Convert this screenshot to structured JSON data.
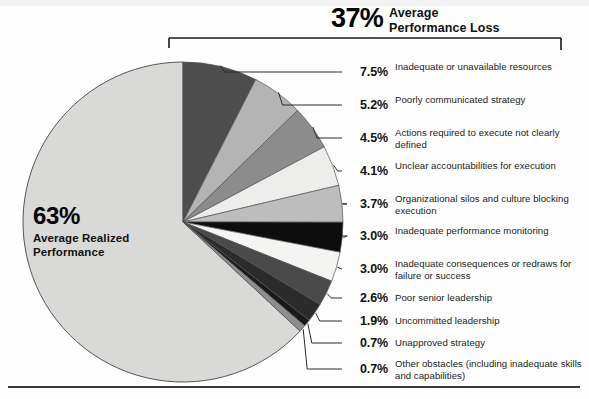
{
  "header": {
    "percent": "37%",
    "line1": "Average",
    "line2": "Performance Loss"
  },
  "center": {
    "percent": "63%",
    "line1": "Average Realized",
    "line2": "Performance"
  },
  "chart_data": {
    "type": "pie",
    "title": "37% Average Performance Loss",
    "center_label": "63% Average Realized Performance",
    "units": "percent",
    "legend_position": "right",
    "grid": false,
    "categories": [
      "Average Realized Performance",
      "Inadequate or unavailable resources",
      "Poorly communicated strategy",
      "Actions required to execute not clearly defined",
      "Unclear accountabilities for execution",
      "Organizational silos and culture blocking execution",
      "Inadequate performance monitoring",
      "Inadequate consequences or redraws for failure or success",
      "Poor senior leadership",
      "Uncommitted leadership",
      "Unapproved strategy",
      "Other obstacles (including inadequate skills and capabilities)"
    ],
    "values": [
      63.0,
      7.5,
      5.2,
      4.5,
      4.1,
      3.7,
      3.0,
      3.0,
      2.6,
      1.9,
      0.7,
      0.7
    ],
    "colors": [
      "#d9d9d7",
      "#4d4d4d",
      "#b4b4b4",
      "#8c8c8c",
      "#ededeb",
      "#bdbdbd",
      "#0d0d0d",
      "#f4f4f2",
      "#4a4a4a",
      "#2b2b2b",
      "#1a1a1a",
      "#8e8e8e"
    ],
    "loss_total": 37.0,
    "realized_total": 63.0
  },
  "labels": [
    {
      "percent": "7.5%",
      "text": "Inadequate or unavailable resources",
      "pct_top": 65,
      "txt_top": 61
    },
    {
      "percent": "5.2%",
      "text": "Poorly communicated strategy",
      "pct_top": 98,
      "txt_top": 94
    },
    {
      "percent": "4.5%",
      "text": "Actions required to execute not clearly defined",
      "pct_top": 131,
      "txt_top": 127
    },
    {
      "percent": "4.1%",
      "text": "Unclear accountabilities for execution",
      "pct_top": 164,
      "txt_top": 160
    },
    {
      "percent": "3.7%",
      "text": "Organizational silos and culture blocking execution",
      "pct_top": 197,
      "txt_top": 193
    },
    {
      "percent": "3.0%",
      "text": "Inadequate performance monitoring",
      "pct_top": 229,
      "txt_top": 225
    },
    {
      "percent": "3.0%",
      "text": "Inadequate consequences or redraws for failure or success",
      "pct_top": 262,
      "txt_top": 258
    },
    {
      "percent": "2.6%",
      "text": "Poor senior leadership",
      "pct_top": 291,
      "txt_top": 292
    },
    {
      "percent": "1.9%",
      "text": "Uncommitted leadership",
      "pct_top": 314,
      "txt_top": 315
    },
    {
      "percent": "0.7%",
      "text": "Unapproved strategy",
      "pct_top": 336,
      "txt_top": 337
    },
    {
      "percent": "0.7%",
      "text": "Other obstacles (including inadequate skills and capabilities)",
      "pct_top": 362,
      "txt_top": 358
    }
  ]
}
